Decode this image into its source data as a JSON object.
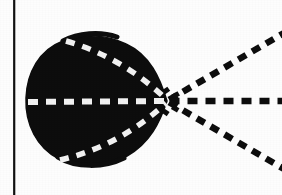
{
  "figure": {
    "background_color": "#fdfdfd",
    "ink_color": "#0d0d0d",
    "dash_light_color": "#f2f2f2",
    "border": {
      "left_rule": {
        "present": true,
        "x": 13.5,
        "y_start": 0,
        "y_end": 195,
        "width": 2.2,
        "color": "#111111"
      },
      "top_rule_present": false,
      "bottom_rule_present": false,
      "right_rule_present": false
    },
    "lobe": {
      "name": "filled-lobe",
      "fill_color": "#0d0d0d",
      "bounds": {
        "left": 26,
        "right": 167,
        "top": 36,
        "bottom": 165
      },
      "cusp_point": {
        "x": 167,
        "y": 101
      },
      "center": {
        "x": 95,
        "y": 101
      },
      "radius_x": 69,
      "radius_y": 65,
      "description": "near-circular lobe drawn with a pointed cusp at its right vertex"
    },
    "rays": [
      {
        "name": "ray-upper",
        "color": "#0d0d0d",
        "from": {
          "x": 167,
          "y": 101
        },
        "to": {
          "x": 282,
          "y": 34
        },
        "angle_deg": 30.2,
        "dash_pattern": "9 7",
        "stroke_width": 6.5
      },
      {
        "name": "ray-middle",
        "color": "#0d0d0d",
        "from": {
          "x": 167,
          "y": 101
        },
        "to": {
          "x": 282,
          "y": 101
        },
        "angle_deg": 0,
        "dash_pattern": "10 8",
        "stroke_width": 6.5
      },
      {
        "name": "ray-lower",
        "color": "#0d0d0d",
        "from": {
          "x": 167,
          "y": 101
        },
        "to": {
          "x": 282,
          "y": 168
        },
        "angle_deg": -30.2,
        "dash_pattern": "9 7",
        "stroke_width": 6.5
      }
    ],
    "inner_dashes": [
      {
        "name": "inner-axis-dash",
        "color": "#f2f2f2",
        "from": {
          "x": 28,
          "y": 102
        },
        "to": {
          "x": 166,
          "y": 101
        },
        "dash_pattern": "10 8",
        "stroke_width": 6
      },
      {
        "name": "inner-upper-dash",
        "color": "#f2f2f2",
        "from": {
          "x": 66,
          "y": 41
        },
        "control": {
          "x": 122,
          "y": 57
        },
        "to": {
          "x": 166,
          "y": 99
        },
        "dash_pattern": "9 8",
        "stroke_width": 5.5
      },
      {
        "name": "inner-lower-dash",
        "color": "#f2f2f2",
        "from": {
          "x": 60,
          "y": 160
        },
        "control": {
          "x": 120,
          "y": 146
        },
        "to": {
          "x": 166,
          "y": 103
        },
        "dash_pattern": "9 8",
        "stroke_width": 5.5
      }
    ],
    "labels": []
  }
}
